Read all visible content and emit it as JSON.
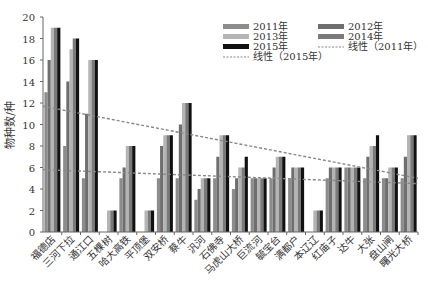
{
  "chart_data": {
    "type": "bar",
    "title": "",
    "xlabel": "",
    "ylabel": "物种数/种",
    "ylim": [
      0,
      20
    ],
    "yticks": [
      0,
      2,
      4,
      6,
      8,
      10,
      12,
      14,
      16,
      18,
      20
    ],
    "grid": false,
    "legend_position": "top-right",
    "categories": [
      "福德店",
      "三河下拉",
      "通江口",
      "五棵树",
      "哈大高铁",
      "平顶堡",
      "双安桥",
      "蔡牛",
      "汎河",
      "石佛寺",
      "马虎山大桥",
      "巨流河",
      "毓宝台",
      "满都户",
      "本辽辽",
      "红庙子",
      "达牛",
      "大张",
      "盘山闸",
      "曙光大桥"
    ],
    "series": [
      {
        "name": "2011年",
        "color": "#8c8c8c",
        "values": [
          13,
          8,
          5,
          0,
          5,
          0,
          5,
          5,
          3,
          5,
          4,
          5,
          5,
          5,
          0,
          5,
          6,
          5,
          5,
          5
        ]
      },
      {
        "name": "2012年",
        "color": "#6e6e6e",
        "values": [
          16,
          14,
          11,
          0,
          6,
          0,
          8,
          10,
          4,
          7,
          5,
          5,
          6,
          6,
          0,
          6,
          6,
          7,
          5,
          7
        ]
      },
      {
        "name": "2013年",
        "color": "#b4b4b4",
        "values": [
          19,
          17,
          16,
          2,
          8,
          2,
          9,
          12,
          5,
          9,
          6,
          5,
          7,
          6,
          2,
          6,
          6,
          8,
          6,
          9
        ]
      },
      {
        "name": "2014年",
        "color": "#7a7a7a",
        "values": [
          19,
          18,
          16,
          2,
          8,
          2,
          9,
          12,
          5,
          9,
          6,
          5,
          7,
          6,
          2,
          6,
          6,
          8,
          6,
          9
        ]
      },
      {
        "name": "2015年",
        "color": "#111111",
        "values": [
          19,
          18,
          16,
          2,
          8,
          2,
          9,
          12,
          5,
          9,
          7,
          5,
          7,
          6,
          2,
          6,
          6,
          9,
          6,
          9
        ]
      }
    ],
    "trendlines": [
      {
        "name": "线性（2011年）",
        "start": 5.8,
        "end": 4.5,
        "color": "#888888"
      },
      {
        "name": "线性（2015年）",
        "start": 11.7,
        "end": 5.0,
        "color": "#888888"
      }
    ]
  },
  "legend": [
    {
      "label": "2011年",
      "kind": "bar",
      "color": "#8c8c8c"
    },
    {
      "label": "2012年",
      "kind": "bar",
      "color": "#6e6e6e"
    },
    {
      "label": "2013年",
      "kind": "bar",
      "color": "#b4b4b4"
    },
    {
      "label": "2014年",
      "kind": "bar",
      "color": "#7a7a7a"
    },
    {
      "label": "2015年",
      "kind": "bar",
      "color": "#111111"
    },
    {
      "label": "线性（2011年）",
      "kind": "line",
      "color": "#888888"
    },
    {
      "label": "线性（2015年）",
      "kind": "line",
      "color": "#888888"
    }
  ]
}
